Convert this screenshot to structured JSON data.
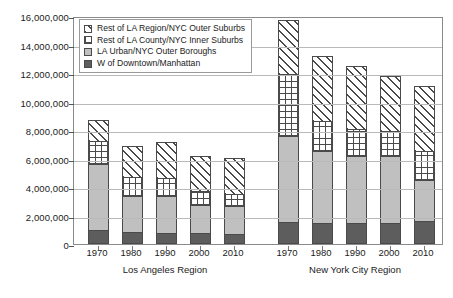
{
  "chart_data": {
    "type": "bar",
    "subtype": "stacked-grouped-column",
    "title": "",
    "xlabel": "",
    "ylabel": "",
    "ylim": [
      0,
      16000000
    ],
    "ytick_step": 2000000,
    "ytick_labels": [
      "0",
      "2,000,000",
      "4,000,000",
      "6,000,000",
      "8,000,000",
      "10,000,000",
      "12,000,000",
      "14,000,000",
      "16,000,000"
    ],
    "ytick_values": [
      0,
      2000000,
      4000000,
      6000000,
      8000000,
      10000000,
      12000000,
      14000000,
      16000000
    ],
    "grid": true,
    "legend_position": "top-left-inside",
    "categories": [
      "1970",
      "1980",
      "1990",
      "2000",
      "2010"
    ],
    "groups": [
      {
        "name": "Los Angeles Region",
        "categories": [
          "1970",
          "1980",
          "1990",
          "2000",
          "2010"
        ]
      },
      {
        "name": "New York City Region",
        "categories": [
          "1970",
          "1980",
          "1990",
          "2000",
          "2010"
        ]
      }
    ],
    "series": [
      {
        "name": "W of Downtown/Manhattan",
        "key": "w_downtown",
        "pattern": "solid-dark",
        "color": "#5d5d5d",
        "values_la": [
          1000000,
          850000,
          800000,
          750000,
          700000
        ],
        "values_nyc": [
          1550000,
          1450000,
          1500000,
          1500000,
          1600000
        ]
      },
      {
        "name": "LA Urban/NYC Outer Boroughs",
        "key": "urban_outer_boroughs",
        "pattern": "solid-light",
        "color": "#c0c0c0",
        "values_la": [
          4600000,
          2550000,
          2550000,
          2000000,
          2000000
        ],
        "values_nyc": [
          6000000,
          5100000,
          4700000,
          4700000,
          2900000
        ]
      },
      {
        "name": "Rest of LA County/NYC Inner Suburbs",
        "key": "rest_county_inner_suburbs",
        "pattern": "cross-hatch",
        "color": "#ffffff",
        "values_la": [
          1600000,
          1300000,
          1300000,
          1000000,
          800000
        ],
        "values_nyc": [
          4350000,
          2050000,
          1900000,
          1700000,
          2000000
        ]
      },
      {
        "name": "Rest of LA Region/NYC Outer Suburbs",
        "key": "rest_region_outer_suburbs",
        "pattern": "diagonal-hatch",
        "color": "#ffffff",
        "values_la": [
          1500000,
          2200000,
          2500000,
          2400000,
          2550000
        ],
        "values_nyc": [
          3800000,
          4600000,
          4400000,
          3900000,
          4600000
        ]
      }
    ],
    "totals_la": [
      8700000,
      6900000,
      7150000,
      6150000,
      6050000
    ],
    "totals_nyc": [
      15700000,
      13200000,
      12500000,
      11800000,
      11100000
    ]
  },
  "legend": {
    "items": [
      {
        "label": "Rest of LA Region/NYC Outer Suburbs",
        "swatch": "diagonal-hatch-swatch"
      },
      {
        "label": "Rest of LA County/NYC Inner Suburbs",
        "swatch": "cross-hatch-swatch"
      },
      {
        "label": "LA Urban/NYC Outer Boroughs",
        "swatch": "light-gray-swatch"
      },
      {
        "label": "W of Downtown/Manhattan",
        "swatch": "dark-gray-swatch"
      }
    ]
  },
  "colors": {
    "w_downtown": "#5d5d5d",
    "urban_outer_boroughs": "#c0c0c0",
    "hatch_stroke": "#4a4a4a",
    "gridline": "#b9b9b9",
    "frame": "#8a8a8a",
    "text": "#1b1b1b",
    "background": "#ffffff"
  }
}
